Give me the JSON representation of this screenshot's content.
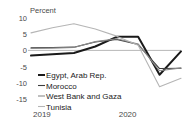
{
  "chart_data": {
    "type": "line",
    "title": "",
    "ylabel": "Percent",
    "xlabel": "",
    "ylim": [
      -15,
      10
    ],
    "yticks": [
      10,
      5,
      0,
      -5,
      -10,
      -15
    ],
    "ytick_labels": [
      "10",
      "5",
      "0",
      "-5",
      "-10",
      "-15"
    ],
    "xlim": [
      0,
      7
    ],
    "x": [
      0,
      1,
      2,
      3,
      4,
      5,
      6,
      7
    ],
    "xticks": [
      0,
      4
    ],
    "xtick_labels": [
      "2019",
      "2020"
    ],
    "grid": false,
    "zero_line": true,
    "legend_position": "inside-lower-left",
    "series": [
      {
        "name": "Egypt, Arab Rep.",
        "color": "#1a1a1a",
        "width": 2.0,
        "values": [
          -1.6,
          -1.2,
          -0.8,
          1.2,
          4.2,
          4.2,
          -7.5,
          -0.3
        ]
      },
      {
        "name": "Morocco",
        "color": "#3d3d3d",
        "width": 1.1,
        "values": [
          0.8,
          0.9,
          1.0,
          2.6,
          3.4,
          1.8,
          -5.6,
          -5.5
        ]
      },
      {
        "name": "West Bank and Gaza",
        "color": "#8a8a8a",
        "width": 1.1,
        "values": [
          0.6,
          0.7,
          0.9,
          2.7,
          3.6,
          2.0,
          -6.3,
          -5.4
        ]
      },
      {
        "name": "Tunisia",
        "color": "#b5b5b5",
        "width": 1.1,
        "values": [
          5.4,
          7.0,
          8.2,
          6.6,
          4.4,
          1.6,
          -11.2,
          -8.6
        ]
      }
    ]
  },
  "axis": {
    "unit_label": "Percent"
  },
  "legend": {
    "items": [
      {
        "label": "Egypt, Arab Rep.",
        "color": "#1a1a1a",
        "width": 2.0
      },
      {
        "label": "Morocco",
        "color": "#3d3d3d",
        "width": 1.1
      },
      {
        "label": "West Bank and Gaza",
        "color": "#8a8a8a",
        "width": 1.1
      },
      {
        "label": "Tunisia",
        "color": "#b5b5b5",
        "width": 1.1
      }
    ]
  }
}
